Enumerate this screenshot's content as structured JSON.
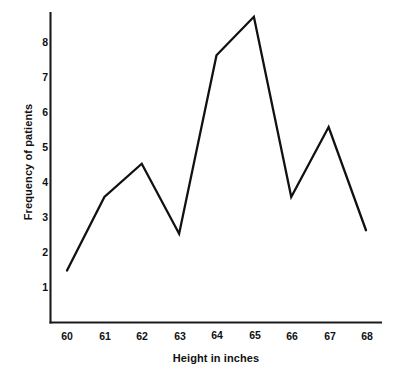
{
  "chart_data": {
    "type": "line",
    "title": "",
    "subtitle": "",
    "xlabel": "Height in inches",
    "ylabel": "Frequency of patients",
    "x": [
      60,
      61,
      62,
      63,
      64,
      65,
      66,
      67,
      68
    ],
    "categories": [
      "60",
      "61",
      "62",
      "63",
      "64",
      "65",
      "66",
      "67",
      "68"
    ],
    "values": [
      1.5,
      3.6,
      4.55,
      2.55,
      7.65,
      8.75,
      3.6,
      5.6,
      2.65
    ],
    "series": [
      {
        "name": "Frequency of patients",
        "values": [
          1.5,
          3.6,
          4.55,
          2.55,
          7.65,
          8.75,
          3.6,
          5.6,
          2.65
        ]
      }
    ],
    "xticks": [
      "60",
      "61",
      "62",
      "63",
      "64",
      "65",
      "66",
      "67",
      "68"
    ],
    "yticks": [
      "1",
      "2",
      "3",
      "4",
      "5",
      "6",
      "7",
      "8"
    ],
    "xlim": [
      59.55,
      68.45
    ],
    "ylim": [
      0.0,
      9.2
    ],
    "grid": false,
    "legend": false,
    "legend_position": "none",
    "line_color": "#111111",
    "markers": "none",
    "annotations": []
  },
  "axes": {
    "y_title": "Frequency of patients",
    "x_title": "Height in inches",
    "y_ticks": [
      {
        "label": "8",
        "value": 8
      },
      {
        "label": "7",
        "value": 7
      },
      {
        "label": "6",
        "value": 6
      },
      {
        "label": "5",
        "value": 5
      },
      {
        "label": "4",
        "value": 4
      },
      {
        "label": "3",
        "value": 3
      },
      {
        "label": "2",
        "value": 2
      },
      {
        "label": "1",
        "value": 1
      }
    ],
    "x_ticks": [
      {
        "label": "60",
        "value": 60
      },
      {
        "label": "61",
        "value": 61
      },
      {
        "label": "62",
        "value": 62
      },
      {
        "label": "63",
        "value": 63
      },
      {
        "label": "64",
        "value": 64
      },
      {
        "label": "65",
        "value": 65
      },
      {
        "label": "66",
        "value": 66
      },
      {
        "label": "67",
        "value": 67
      },
      {
        "label": "68",
        "value": 68
      }
    ]
  },
  "colors": {
    "line": "#111111",
    "axis": "#1a1a1a",
    "background": "#ffffff",
    "text": "#111111"
  }
}
